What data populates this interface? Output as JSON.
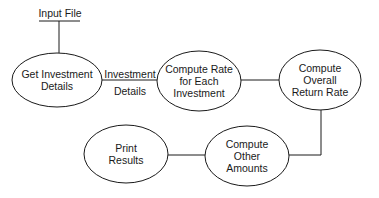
{
  "diagram": {
    "input": {
      "label": "Input File"
    },
    "nodes": [
      {
        "id": "get-investment-details",
        "lines": [
          "Get Investment",
          "Details"
        ]
      },
      {
        "id": "compute-rate",
        "lines": [
          "Compute Rate",
          "for Each",
          "Investment"
        ]
      },
      {
        "id": "compute-overall",
        "lines": [
          "Compute",
          "Overall",
          "Return Rate"
        ]
      },
      {
        "id": "compute-other",
        "lines": [
          "Compute",
          "Other",
          "Amounts"
        ]
      },
      {
        "id": "print-results",
        "lines": [
          "Print",
          "Results"
        ]
      }
    ],
    "edges": [
      {
        "from": "input",
        "to": "get-investment-details",
        "label": ""
      },
      {
        "from": "get-investment-details",
        "to": "compute-rate",
        "label": [
          "Investment",
          "Details"
        ]
      },
      {
        "from": "compute-rate",
        "to": "compute-overall",
        "label": ""
      },
      {
        "from": "compute-overall",
        "to": "compute-other",
        "label": ""
      },
      {
        "from": "compute-other",
        "to": "print-results",
        "label": ""
      }
    ],
    "colors": {
      "stroke": "#1a1a1a",
      "background": "#ffffff"
    }
  }
}
